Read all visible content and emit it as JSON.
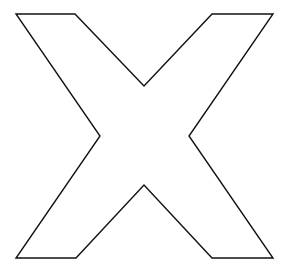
{
  "figure": {
    "letter": "X",
    "stroke_color": "#111111",
    "fill_color": "#ffffff",
    "background_color": "#ffffff",
    "stroke_width": 1.4,
    "outline_points": "16,14 75,14 144,86 212,14 273,14 189,136 273,258 212,258 144,185 76,258 16,258 100,136"
  }
}
